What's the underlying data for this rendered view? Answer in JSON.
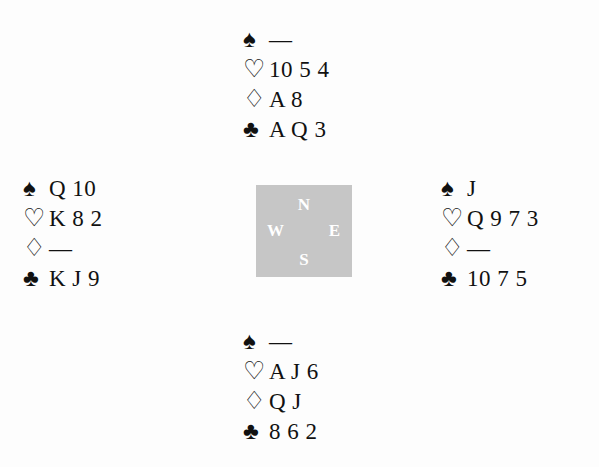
{
  "diagram": {
    "type": "bridge-hand-diagram",
    "background_color": "#fdfdfd",
    "ink_color": "#111111"
  },
  "suits": {
    "spade_glyph": "♠",
    "heart_glyph": "♡",
    "diamond_glyph": "♢",
    "club_glyph": "♣",
    "void_glyph": "—"
  },
  "compass": {
    "background_color": "#c6c6c6",
    "label_color": "#ffffff",
    "north": "N",
    "west": "W",
    "east": "E",
    "south": "S"
  },
  "hands": {
    "north": {
      "position": "North",
      "spades": "—",
      "hearts": "10 5 4",
      "diamonds": "A 8",
      "clubs": "A Q 3"
    },
    "west": {
      "position": "West",
      "spades": "Q 10",
      "hearts": "K 8 2",
      "diamonds": "—",
      "clubs": "K J 9"
    },
    "east": {
      "position": "East",
      "spades": "J",
      "hearts": "Q 9 7 3",
      "diamonds": "—",
      "clubs": "10 7 5"
    },
    "south": {
      "position": "South",
      "spades": "—",
      "hearts": "A J 6",
      "diamonds": "Q J",
      "clubs": "8 6 2"
    }
  }
}
